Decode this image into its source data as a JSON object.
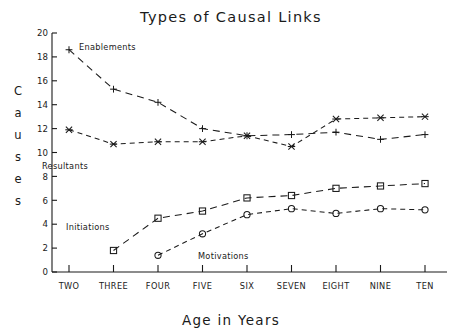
{
  "chart_data": {
    "type": "line",
    "title": "Types of Causal Links",
    "xlabel": "Age in Years",
    "ylabel": "Causes",
    "ylabel_chars": [
      "C",
      "a",
      "u",
      "s",
      "e",
      "s"
    ],
    "categories": [
      "TWO",
      "THREE",
      "FOUR",
      "FIVE",
      "SIX",
      "SEVEN",
      "EIGHT",
      "NINE",
      "TEN"
    ],
    "ylim": [
      0,
      20
    ],
    "yticks": [
      0,
      2,
      4,
      6,
      8,
      10,
      12,
      14,
      16,
      18,
      20
    ],
    "ytick_labels": [
      "0",
      "2",
      "4",
      "6",
      "8",
      "10",
      "12",
      "14",
      "16",
      "18",
      "20"
    ],
    "grid": false,
    "legend": "inline-annotations",
    "series": [
      {
        "name": "Enablements",
        "marker": "plus",
        "linestyle": "dashed",
        "x": [
          "TWO",
          "THREE",
          "FOUR",
          "FIVE",
          "SIX",
          "SEVEN",
          "EIGHT",
          "NINE",
          "TEN"
        ],
        "values": [
          18.6,
          15.3,
          14.2,
          12.0,
          11.4,
          11.5,
          11.7,
          11.1,
          11.5
        ]
      },
      {
        "name": "Resultants",
        "marker": "cross",
        "linestyle": "dashed",
        "x": [
          "TWO",
          "THREE",
          "FOUR",
          "FIVE",
          "SIX",
          "SEVEN",
          "EIGHT",
          "NINE",
          "TEN"
        ],
        "values": [
          11.9,
          10.7,
          10.9,
          10.9,
          11.4,
          10.5,
          12.8,
          12.9,
          13.0
        ]
      },
      {
        "name": "Initiations",
        "marker": "square",
        "linestyle": "dashed",
        "x": [
          "THREE",
          "FOUR",
          "FIVE",
          "SIX",
          "SEVEN",
          "EIGHT",
          "NINE",
          "TEN"
        ],
        "values": [
          1.8,
          4.5,
          5.1,
          6.2,
          6.4,
          7.0,
          7.2,
          7.4
        ]
      },
      {
        "name": "Motivations",
        "marker": "circle",
        "linestyle": "dashed",
        "x": [
          "FOUR",
          "FIVE",
          "SIX",
          "SEVEN",
          "EIGHT",
          "NINE",
          "TEN"
        ],
        "values": [
          1.4,
          3.2,
          4.8,
          5.3,
          4.9,
          5.3,
          5.2
        ]
      }
    ],
    "annotations": [
      {
        "text": "Enablements",
        "x_px": 79,
        "y_px": 50
      },
      {
        "text": "Resultants",
        "x_px": 42,
        "y_px": 169
      },
      {
        "text": "Initiations",
        "x_px": 66,
        "y_px": 230
      },
      {
        "text": "Motivations",
        "x_px": 198,
        "y_px": 259
      }
    ],
    "colors": {
      "ink": "#1a1a1a",
      "background": "#ffffff"
    }
  }
}
